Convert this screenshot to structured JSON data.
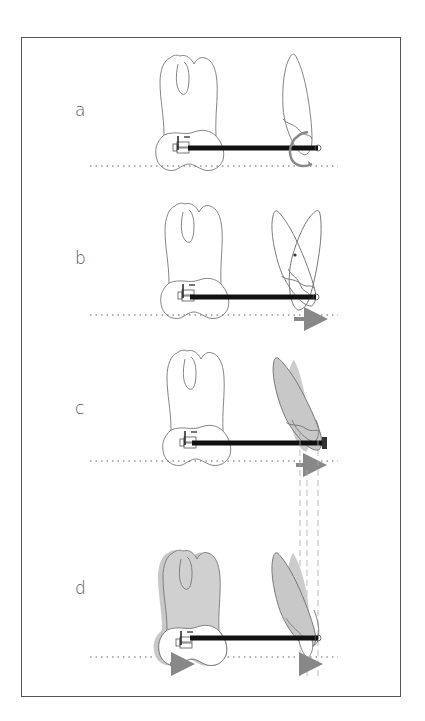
{
  "figure": {
    "type": "orthodontic tooth movement diagram",
    "panels": [
      {
        "id": "a",
        "label": "a",
        "description": "Molar with bracket, archwire to canine; circular spring/rotation element on canine"
      },
      {
        "id": "b",
        "label": "b",
        "description": "Canine tipping around center of rotation (dot), arrow showing movement"
      },
      {
        "id": "c",
        "label": "c",
        "description": "Canine tipped distally (shaded displaced position), arrow movement"
      },
      {
        "id": "d",
        "label": "d",
        "description": "Molar and canine both shaded showing anchorage loss, arrows under both teeth; dashed reference lines"
      }
    ]
  },
  "colors": {
    "outline": "#777777",
    "wire": "#111111",
    "shaded": "#c8c8c8",
    "shadow": "#dddddd",
    "arrow": "#888888",
    "baseline": "#666666",
    "frame": "#555555",
    "label": "#555555"
  }
}
